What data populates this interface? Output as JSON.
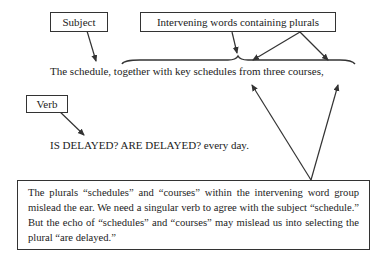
{
  "labels": {
    "subject": "Subject",
    "intervening": "Intervening words containing plurals",
    "verb": "Verb"
  },
  "sentence": {
    "main": "The schedule, together with key schedules from three courses,",
    "verb_line": "IS DELAYED? ARE DELAYED? every day."
  },
  "explanation": "The plurals “schedules” and “courses” within the intervening word group mislead the ear. We need a singular verb to agree with the subject “schedule.” But the echo of “schedules” and “courses” may mislead us into selecting the plural “are delayed.”",
  "colors": {
    "stroke": "#333333",
    "text": "#222222",
    "background": "#ffffff"
  }
}
